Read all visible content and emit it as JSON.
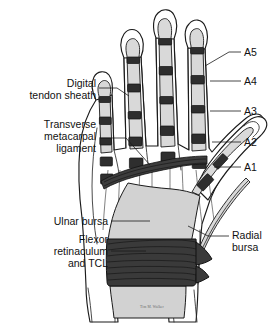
{
  "figure": {
    "background_color": "#ffffff",
    "width": 280,
    "height": 327,
    "signature": "Tim M. Walker"
  },
  "colors": {
    "outline": "#1b1b1b",
    "sheath_fill": "#d9d9d9",
    "bursa_fill": "#d2d2d2",
    "pulley_fill": "#2e2e2e",
    "retinaculum_fill": "#3a3a3a",
    "label_text": "#111111",
    "leader_line": "#1a1a1a"
  },
  "labels": {
    "left": [
      {
        "id": "digital-tendon-sheath",
        "lines": [
          "Digital",
          "tendon sheath"
        ],
        "x": 96,
        "y": 90,
        "align": "end"
      },
      {
        "id": "transverse-metacarpal-ligament",
        "lines": [
          "Transverse",
          "metacarpal",
          "ligament"
        ],
        "x": 96,
        "y": 131,
        "align": "end"
      },
      {
        "id": "ulnar-bursa",
        "lines": [
          "Ulnar bursa"
        ],
        "x": 108,
        "y": 222,
        "align": "end"
      },
      {
        "id": "flexor-retinaculum-and-tcl",
        "lines": [
          "Flexor",
          "retinaculum",
          "and TCL"
        ],
        "x": 108,
        "y": 243,
        "align": "end"
      }
    ],
    "right": [
      {
        "id": "radial-bursa",
        "lines": [
          "Radial",
          "bursa"
        ],
        "x": 232,
        "y": 235,
        "align": "start"
      }
    ],
    "pulleys": [
      {
        "id": "pulley-a5",
        "text": "A5",
        "x": 244,
        "y": 52
      },
      {
        "id": "pulley-a4",
        "text": "A4",
        "x": 244,
        "y": 81
      },
      {
        "id": "pulley-a3",
        "text": "A3",
        "x": 244,
        "y": 111
      },
      {
        "id": "pulley-a2",
        "text": "A2",
        "x": 244,
        "y": 142
      },
      {
        "id": "pulley-a1",
        "text": "A1",
        "x": 244,
        "y": 167
      }
    ]
  },
  "anatomy": {
    "structures": [
      "digital tendon sheath",
      "annular pulleys A1-A5",
      "transverse metacarpal ligament",
      "ulnar bursa",
      "radial bursa",
      "flexor retinaculum and transverse carpal ligament"
    ],
    "digits": [
      "index",
      "middle",
      "ring",
      "little",
      "thumb"
    ]
  }
}
